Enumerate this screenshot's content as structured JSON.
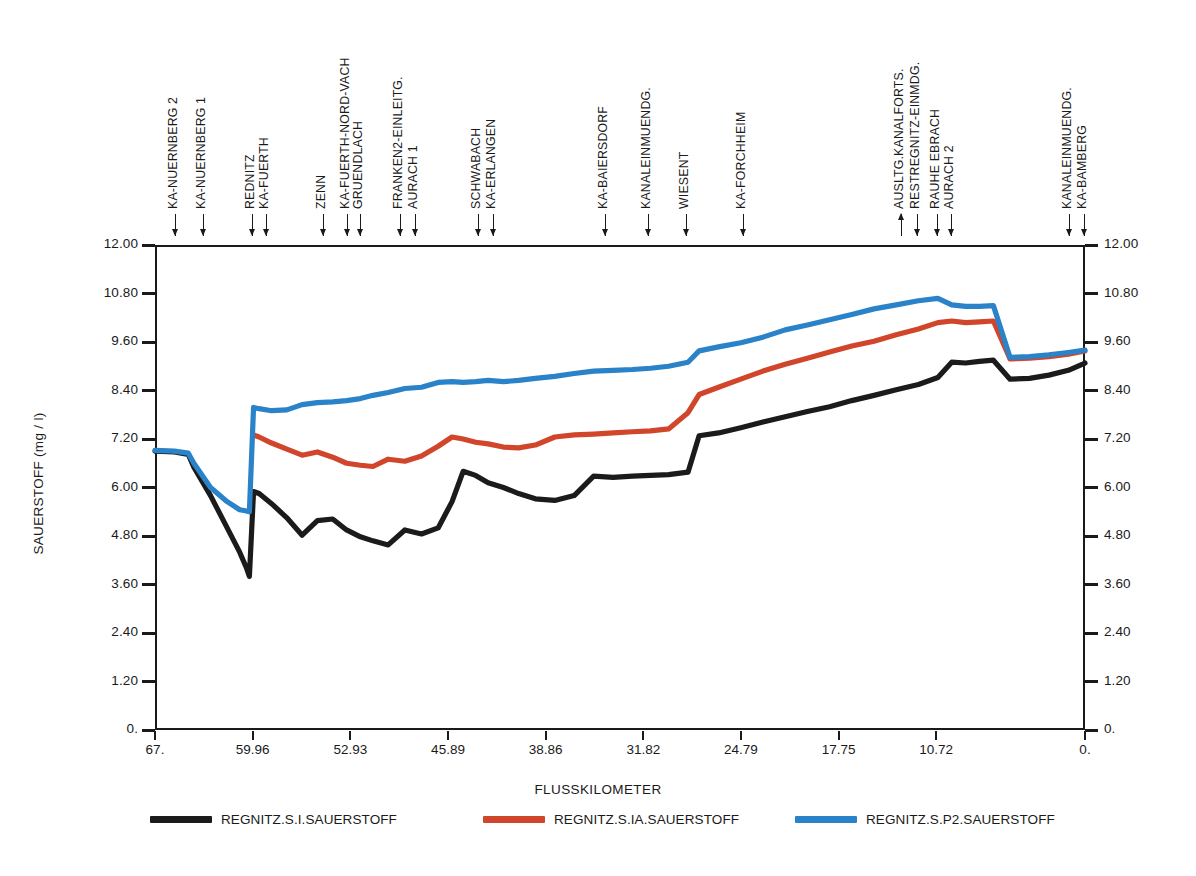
{
  "chart_data": {
    "type": "line",
    "title": "",
    "xlabel": "FLUSSKILOMETER",
    "ylabel": "SAUERSTOFF (mg / l)",
    "xlim": [
      67.0,
      0.0
    ],
    "ylim": [
      0.0,
      12.0
    ],
    "x_reversed": true,
    "grid": false,
    "legend_position": "bottom",
    "y_ticks": [
      "12.00",
      "10.80",
      "9.60",
      "8.40",
      "7.20",
      "6.00",
      "4.80",
      "3.60",
      "2.40",
      "1.20",
      "0."
    ],
    "y_tick_values": [
      12.0,
      10.8,
      9.6,
      8.4,
      7.2,
      6.0,
      4.8,
      3.6,
      2.4,
      1.2,
      0.0
    ],
    "y_axis_right_ticks": [
      "12.00",
      "10.80",
      "9.60",
      "8.40",
      "7.20",
      "6.00",
      "4.80",
      "3.60",
      "2.40",
      "1.20",
      "0."
    ],
    "x_ticks": [
      "67.",
      "59.96",
      "52.93",
      "45.89",
      "38.86",
      "31.82",
      "24.79",
      "17.75",
      "10.72",
      "0."
    ],
    "x_tick_values": [
      67.0,
      59.96,
      52.93,
      45.89,
      38.86,
      31.82,
      24.79,
      17.75,
      10.72,
      0.0
    ],
    "series": [
      {
        "name": "REGNITZ.S.I.SAUERSTOFF",
        "color": "#1b1b1b",
        "x": [
          67.0,
          65.6,
          64.6,
          64.2,
          63.0,
          61.8,
          60.9,
          60.4,
          60.2,
          59.9,
          59.5,
          58.6,
          57.5,
          56.4,
          55.3,
          54.2,
          53.2,
          52.2,
          51.3,
          50.2,
          49.0,
          47.8,
          46.6,
          45.6,
          44.8,
          43.9,
          43.0,
          41.9,
          40.8,
          39.6,
          38.2,
          36.8,
          35.4,
          34.0,
          32.6,
          31.3,
          30.0,
          28.6,
          27.8,
          26.4,
          24.8,
          23.2,
          21.6,
          20.0,
          18.4,
          16.8,
          15.2,
          13.6,
          12.0,
          10.6,
          9.6,
          8.6,
          7.6,
          6.6,
          5.4,
          4.0,
          2.6,
          1.2,
          0.0
        ],
        "y": [
          6.9,
          6.88,
          6.82,
          6.5,
          5.8,
          5.0,
          4.4,
          4.0,
          3.8,
          5.9,
          5.85,
          5.6,
          5.25,
          4.82,
          5.18,
          5.22,
          4.95,
          4.78,
          4.68,
          4.58,
          4.95,
          4.85,
          5.0,
          5.65,
          6.4,
          6.3,
          6.12,
          6.0,
          5.85,
          5.72,
          5.68,
          5.8,
          6.28,
          6.25,
          6.28,
          6.3,
          6.32,
          6.38,
          7.28,
          7.35,
          7.48,
          7.62,
          7.75,
          7.88,
          8.0,
          8.15,
          8.28,
          8.42,
          8.55,
          8.72,
          9.1,
          9.08,
          9.12,
          9.15,
          8.68,
          8.7,
          8.78,
          8.9,
          9.08
        ]
      },
      {
        "name": "REGNITZ.S.IA.SAUERSTOFF",
        "color": "#d1462a",
        "x": [
          59.9,
          59.5,
          58.6,
          57.5,
          56.4,
          55.3,
          54.2,
          53.2,
          52.2,
          51.3,
          50.2,
          49.0,
          47.8,
          46.6,
          45.6,
          44.8,
          43.9,
          43.0,
          41.9,
          40.8,
          39.6,
          38.2,
          36.8,
          35.4,
          34.0,
          32.6,
          31.3,
          30.0,
          28.6,
          27.8,
          26.4,
          24.8,
          23.2,
          21.6,
          20.0,
          18.4,
          16.8,
          15.2,
          13.6,
          12.0,
          10.6,
          9.6,
          8.6,
          7.6,
          6.6,
          5.4,
          4.0,
          2.6,
          1.2,
          0.0
        ],
        "y": [
          7.3,
          7.25,
          7.1,
          6.95,
          6.8,
          6.88,
          6.75,
          6.6,
          6.55,
          6.52,
          6.7,
          6.65,
          6.78,
          7.02,
          7.25,
          7.2,
          7.12,
          7.08,
          7.0,
          6.98,
          7.05,
          7.25,
          7.3,
          7.32,
          7.35,
          7.38,
          7.4,
          7.45,
          7.85,
          8.3,
          8.48,
          8.68,
          8.88,
          9.05,
          9.2,
          9.35,
          9.5,
          9.62,
          9.78,
          9.92,
          10.08,
          10.12,
          10.08,
          10.1,
          10.12,
          9.18,
          9.2,
          9.24,
          9.3,
          9.38
        ]
      },
      {
        "name": "REGNITZ.S.P2.SAUERSTOFF",
        "color": "#2a82c8",
        "x": [
          67.0,
          65.6,
          64.6,
          64.2,
          63.0,
          61.8,
          60.9,
          60.4,
          60.2,
          59.9,
          59.5,
          58.6,
          57.5,
          56.4,
          55.3,
          54.2,
          53.2,
          52.2,
          51.3,
          50.2,
          49.0,
          47.8,
          46.6,
          45.6,
          44.8,
          43.9,
          43.0,
          41.9,
          40.8,
          39.6,
          38.2,
          36.8,
          35.4,
          34.0,
          32.6,
          31.3,
          30.0,
          28.6,
          27.8,
          26.4,
          24.8,
          23.2,
          21.6,
          20.0,
          18.4,
          16.8,
          15.2,
          13.6,
          12.0,
          10.6,
          9.6,
          8.6,
          7.6,
          6.6,
          5.4,
          4.0,
          2.6,
          1.2,
          0.0
        ],
        "y": [
          6.92,
          6.9,
          6.85,
          6.6,
          6.0,
          5.65,
          5.45,
          5.42,
          5.4,
          7.98,
          7.95,
          7.9,
          7.92,
          8.05,
          8.1,
          8.12,
          8.15,
          8.2,
          8.28,
          8.35,
          8.45,
          8.48,
          8.6,
          8.62,
          8.6,
          8.62,
          8.65,
          8.62,
          8.65,
          8.7,
          8.75,
          8.82,
          8.88,
          8.9,
          8.92,
          8.95,
          9.0,
          9.1,
          9.38,
          9.48,
          9.58,
          9.72,
          9.9,
          10.02,
          10.15,
          10.28,
          10.42,
          10.52,
          10.62,
          10.68,
          10.52,
          10.48,
          10.48,
          10.5,
          9.22,
          9.24,
          9.28,
          9.34,
          9.4
        ]
      }
    ],
    "stations": [
      {
        "label": "KA-NUERNBERG 2",
        "x_px": 175,
        "direction": "down",
        "tip": 236,
        "len": 22
      },
      {
        "label": "KA-NUERNBERG 1",
        "x_px": 203,
        "direction": "down",
        "tip": 236,
        "len": 22
      },
      {
        "label": "REDNITZ",
        "x_px": 252,
        "direction": "down",
        "tip": 236,
        "len": 22
      },
      {
        "label": "KA-FUERTH",
        "x_px": 266,
        "direction": "down",
        "tip": 236,
        "len": 22
      },
      {
        "label": "ZENN",
        "x_px": 323,
        "direction": "down",
        "tip": 236,
        "len": 22
      },
      {
        "label": "KA-FUERTH-NORD-VACH",
        "x_px": 347,
        "direction": "down",
        "tip": 236,
        "len": 22
      },
      {
        "label": "GRUENDLACH",
        "x_px": 360,
        "direction": "down",
        "tip": 236,
        "len": 22
      },
      {
        "label": "FRANKEN2-EINLEITG.",
        "x_px": 400,
        "direction": "down",
        "tip": 236,
        "len": 22
      },
      {
        "label": "AURACH 1",
        "x_px": 415,
        "direction": "down",
        "tip": 236,
        "len": 22
      },
      {
        "label": "SCHWABACH",
        "x_px": 478,
        "direction": "down",
        "tip": 236,
        "len": 22
      },
      {
        "label": "KA-ERLANGEN",
        "x_px": 493,
        "direction": "down",
        "tip": 236,
        "len": 22
      },
      {
        "label": "KA-BAIERSDORF",
        "x_px": 605,
        "direction": "down",
        "tip": 236,
        "len": 22
      },
      {
        "label": "KANALEINMUENDG.",
        "x_px": 648,
        "direction": "down",
        "tip": 236,
        "len": 22
      },
      {
        "label": "WIESENT",
        "x_px": 686,
        "direction": "down",
        "tip": 236,
        "len": 22
      },
      {
        "label": "KA-FORCHHEIM",
        "x_px": 743,
        "direction": "down",
        "tip": 236,
        "len": 22
      },
      {
        "label": "AUSLTG.KANALFORTS.",
        "x_px": 901,
        "direction": "up",
        "tip": 236,
        "len": 22
      },
      {
        "label": "RESTREGNITZ-EINMDG.",
        "x_px": 917,
        "direction": "down",
        "tip": 236,
        "len": 22
      },
      {
        "label": "RAUHE EBRACH",
        "x_px": 937,
        "direction": "down",
        "tip": 236,
        "len": 22
      },
      {
        "label": "AURACH 2",
        "x_px": 951,
        "direction": "down",
        "tip": 236,
        "len": 22
      },
      {
        "label": "KANALEINMUENDG.",
        "x_px": 1069,
        "direction": "down",
        "tip": 236,
        "len": 22
      },
      {
        "label": "KA-BAMBERG",
        "x_px": 1084,
        "direction": "down",
        "tip": 236,
        "len": 22
      }
    ]
  },
  "legend": {
    "items": [
      {
        "label": "REGNITZ.S.I.SAUERSTOFF",
        "color": "#1b1b1b",
        "x_px": 150
      },
      {
        "label": "REGNITZ.S.IA.SAUERSTOFF",
        "color": "#d1462a",
        "x_px": 483
      },
      {
        "label": "REGNITZ.S.P2.SAUERSTOFF",
        "color": "#2a82c8",
        "x_px": 795
      }
    ]
  }
}
